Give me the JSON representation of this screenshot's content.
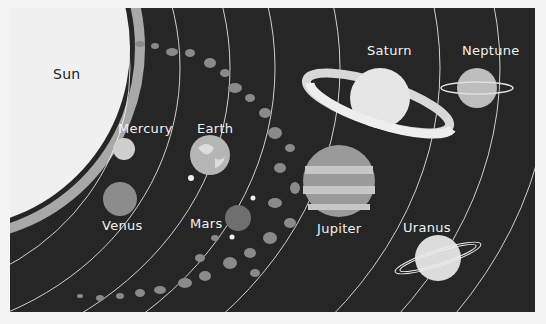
{
  "labels": {
    "sun": "Sun",
    "mercury": "Mercury",
    "venus": "Venus",
    "earth": "Earth",
    "mars": "Mars",
    "jupiter": "Jupiter",
    "saturn": "Saturn",
    "uranus": "Uranus",
    "neptune": "Neptune"
  },
  "colors": {
    "background": "#262626",
    "sun": "#eeeeee",
    "orbit": "#d8d8d8",
    "asteroid": "#8a8a8a",
    "label": "#f2f2f2"
  }
}
